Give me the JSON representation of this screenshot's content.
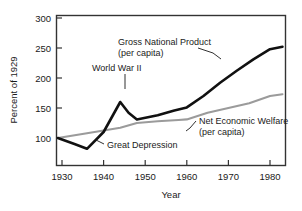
{
  "chart_data": {
    "type": "line",
    "title": "",
    "xlabel": "Year",
    "ylabel": "Percent of 1929",
    "xlim": [
      1929,
      1984
    ],
    "ylim": [
      70,
      300
    ],
    "xticks": [
      1930,
      1940,
      1950,
      1960,
      1970,
      1980
    ],
    "xticklabels": [
      "1930",
      "1940",
      "1950",
      "1960",
      "1970",
      "1980"
    ],
    "yticks": [
      100,
      150,
      200,
      250,
      300
    ],
    "yticklabels": [
      "100",
      "150",
      "200",
      "250",
      "300"
    ],
    "grid": false,
    "legend": "none (inline annotations)",
    "series": [
      {
        "name": "Gross National Product (per capita)",
        "color": "#111111",
        "x": [
          1929,
          1933,
          1936,
          1940,
          1944,
          1946,
          1948,
          1953,
          1957,
          1960,
          1964,
          1968,
          1972,
          1976,
          1980,
          1983
        ],
        "values": [
          100,
          90,
          82,
          110,
          160,
          142,
          131,
          138,
          146,
          151,
          170,
          192,
          212,
          231,
          248,
          252
        ]
      },
      {
        "name": "Net Economic Welfare (per capita)",
        "color": "#9b9b9b",
        "x": [
          1929,
          1936,
          1944,
          1948,
          1953,
          1958,
          1960,
          1965,
          1970,
          1975,
          1980,
          1983
        ],
        "values": [
          100,
          108,
          117,
          125,
          128,
          130,
          131,
          142,
          150,
          158,
          170,
          173
        ]
      }
    ],
    "annotations": [
      {
        "id": "gnp",
        "text_line1": "Gross National Product",
        "text_line2": "(per capita)"
      },
      {
        "id": "wwii",
        "text_line1": "World War II",
        "text_line2": ""
      },
      {
        "id": "great-depression",
        "text_line1": "Great Depression",
        "text_line2": ""
      },
      {
        "id": "new",
        "text_line1": "Net Economic Welfare",
        "text_line2": "(per capita)"
      }
    ]
  }
}
